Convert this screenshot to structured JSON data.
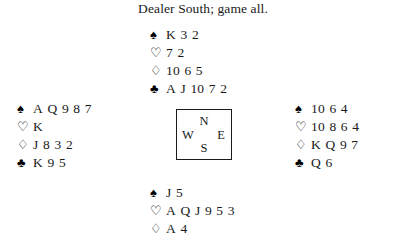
{
  "title": "Dealer South; game all.",
  "suits": {
    "spades": {
      "icon": "spade-icon",
      "glyph": "♠",
      "fill": "solid"
    },
    "hearts": {
      "icon": "heart-icon",
      "glyph": "♡",
      "fill": "hollow"
    },
    "diamonds": {
      "icon": "diamond-icon",
      "glyph": "♢",
      "fill": "hollow"
    },
    "clubs": {
      "icon": "club-icon",
      "glyph": "♣",
      "fill": "solid"
    }
  },
  "compass": {
    "north": "N",
    "west": "W",
    "east": "E",
    "south": "S"
  },
  "hands": {
    "north": {
      "spades": "K 3 2",
      "hearts": "7 2",
      "diamonds": "10 6 5",
      "clubs": "A J 10 7 2"
    },
    "west": {
      "spades": "A Q 9 8 7",
      "hearts": "K",
      "diamonds": "J 8 3 2",
      "clubs": "K 9 5"
    },
    "east": {
      "spades": "10 6 4",
      "hearts": "10 8 6 4",
      "diamonds": "K Q 9 7",
      "clubs": "Q 6"
    },
    "south": {
      "spades": "J 5",
      "hearts": "A Q J 9 5 3",
      "diamonds": "A 4"
    }
  }
}
